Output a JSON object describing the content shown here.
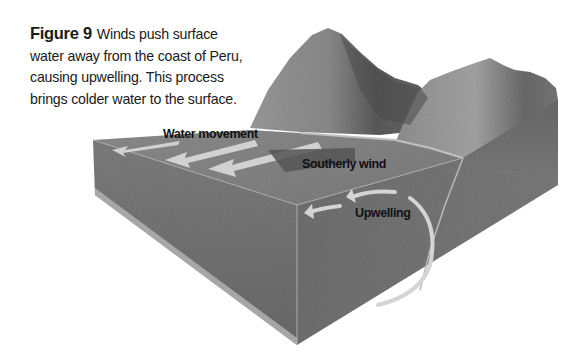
{
  "caption": {
    "figure_label": "Figure 9",
    "lines": [
      "Winds push surface",
      "water away from the coast of Peru,",
      "causing upwelling. This process",
      "brings colder water to the surface."
    ]
  },
  "diagram": {
    "type": "3D ocean block diagram",
    "labels": {
      "water_movement": "Water movement",
      "southerly_wind": "Southerly wind",
      "upwelling": "Upwelling"
    },
    "colors": {
      "background": "#ffffff",
      "water_top": "#8a8a8a",
      "water_side_left": "#7a7a7a",
      "water_side_right": "#6e6e6e",
      "arrow_light": "#d4d4d4",
      "wind_arrow": "#555555",
      "mountain_light": "#a8a8a8",
      "mountain_dark": "#4a4a4a",
      "text": "#111111"
    }
  }
}
